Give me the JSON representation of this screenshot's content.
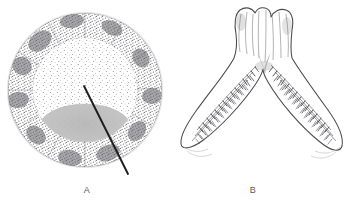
{
  "figure": {
    "background_color": "#ffffff",
    "width": 352,
    "height": 204,
    "ink_color": "#4a4a4c",
    "stipple_color": "#6e6e72",
    "shade_color": "#bcbcbc"
  },
  "panels": [
    {
      "id": "A",
      "label": "A",
      "caption": "A",
      "type": "circular-cross-section",
      "description": "Stippled circular section with dense outer cortex ring, lighter inner medulla, gray lens-shaped basal region, and a diagonal leader line",
      "center": {
        "x": 85,
        "y": 90
      },
      "outer_radius": 77,
      "inner_radius": 52,
      "outer_ring_tone": "dense-stipple",
      "inner_zone_tone": "fine-stipple",
      "shaded_region": {
        "name": "basal-lens",
        "color": "#bcbcbc",
        "center_x": 85,
        "center_y": 128,
        "rx": 46,
        "ry": 23
      },
      "leader_line": {
        "x1": 84,
        "y1": 86,
        "x2": 128,
        "y2": 174,
        "width": 1.8,
        "color": "#1d1d1f"
      }
    },
    {
      "id": "B",
      "label": "B",
      "caption": "B",
      "type": "bilobed-v-structure",
      "description": "V-shaped bilobed organ with two columnar stalks at top and two outspread lamellate wings bearing comb-like transverse ridges",
      "apex": {
        "x": 264,
        "y": 62
      },
      "left_wing_tip": {
        "x": 183,
        "y": 148
      },
      "right_wing_tip": {
        "x": 340,
        "y": 150
      },
      "stalk_top_y": 8,
      "lamellae_rows_per_wing": 3,
      "lamellae_count_per_row": 22
    }
  ],
  "captions": {
    "a": "A",
    "b": "B"
  }
}
